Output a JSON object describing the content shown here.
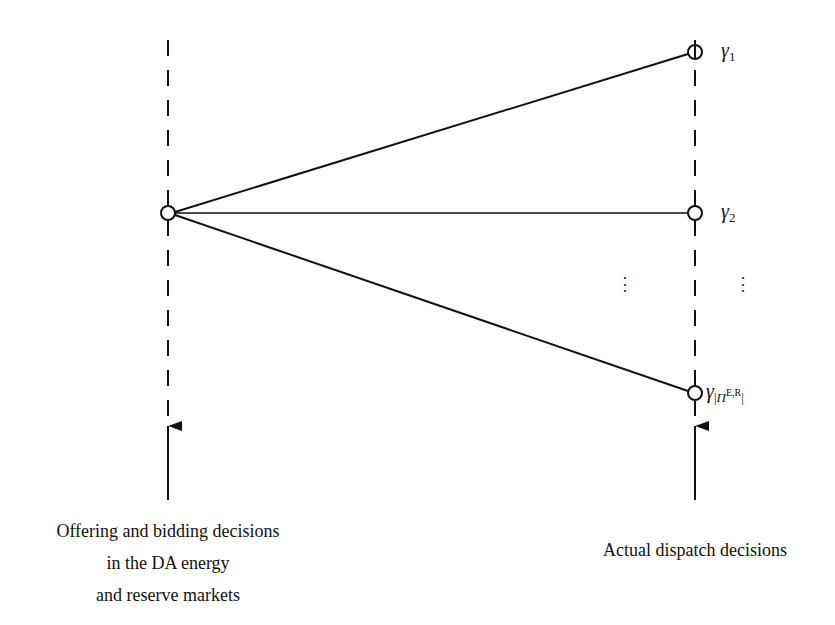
{
  "diagram": {
    "type": "scenario-tree",
    "stages": [
      {
        "id": "stage-1",
        "x": 168,
        "label_lines": [
          "Offering and bidding decisions",
          "in the DA energy",
          "and reserve markets"
        ]
      },
      {
        "id": "stage-2",
        "x": 695,
        "label_lines": [
          "Actual dispatch decisions"
        ]
      }
    ],
    "root_node": {
      "x": 168,
      "y": 213
    },
    "leaf_nodes": [
      {
        "x": 695,
        "y": 52,
        "label": "γ",
        "subscript": "1"
      },
      {
        "x": 695,
        "y": 213,
        "label": "γ",
        "subscript": "2"
      },
      {
        "x": 695,
        "y": 393,
        "label": "γ",
        "subscript_parts": {
          "open": "|",
          "symbol": "Π",
          "superscript": "E,R",
          "close": "|"
        }
      }
    ],
    "ellipsis": "⋮",
    "colors": {
      "line": "#111111",
      "background": "#ffffff"
    }
  }
}
